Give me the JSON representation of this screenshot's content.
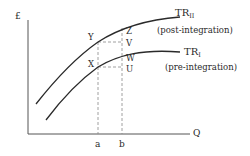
{
  "diagram": {
    "axes": {
      "y_label": "£",
      "x_label": "Q"
    },
    "x_ticks": [
      {
        "label": "a"
      },
      {
        "label": "b"
      }
    ],
    "curves": [
      {
        "name": "TR",
        "subscript": "II",
        "note": "(post-integration)"
      },
      {
        "name": "TR",
        "subscript": "I",
        "note": "(pre-integration)"
      }
    ],
    "points": {
      "Y": "Y",
      "X": "X",
      "Z": "Z",
      "V": "V",
      "W": "W",
      "U": "U"
    },
    "colors": {
      "line": "#2a2a2a",
      "axis": "#555555",
      "dashed": "#888888"
    }
  }
}
